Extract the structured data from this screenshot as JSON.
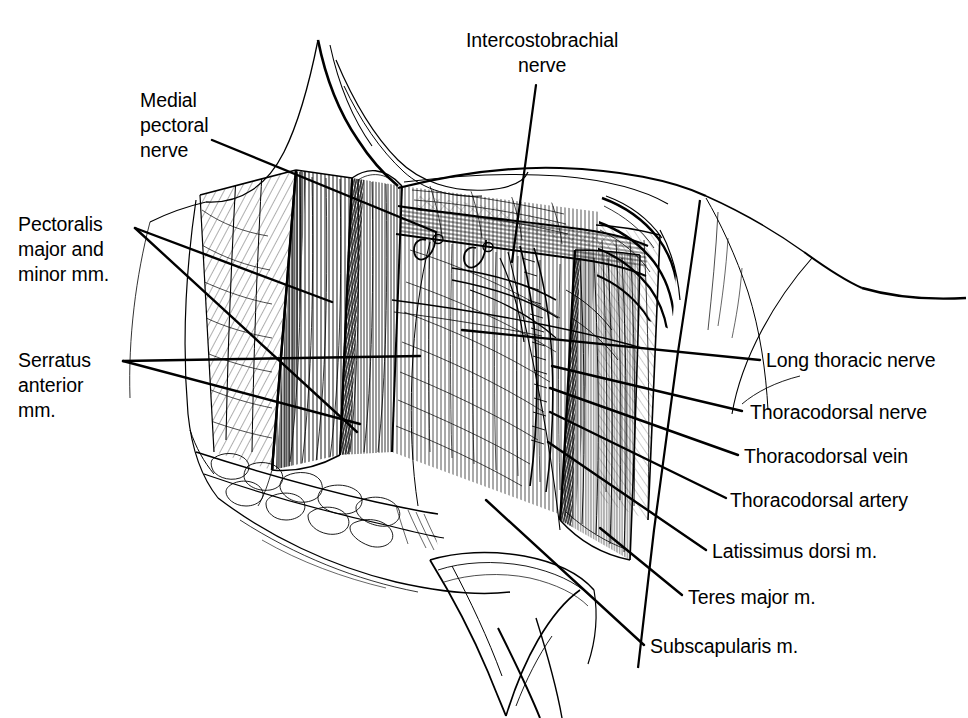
{
  "figure": {
    "kind": "anatomical-line-drawing",
    "style": "black and white pen-and-ink medical illustration",
    "background_color": "#ffffff",
    "ink_color": "#000000"
  },
  "labels": {
    "medial_pectoral_nerve": {
      "lines": [
        "Medial",
        "pectoral",
        "nerve"
      ],
      "text": "Medial pectoral nerve",
      "position": "upper-left",
      "align": "left"
    },
    "pectoralis_major_and_minor": {
      "lines": [
        "Pectoralis",
        "major and",
        "minor mm."
      ],
      "text": "Pectoralis major and minor mm.",
      "position": "mid-left",
      "align": "left"
    },
    "serratus_anterior": {
      "lines": [
        "Serratus",
        "anterior",
        "mm."
      ],
      "text": "Serratus anterior mm.",
      "position": "lower-left",
      "align": "left"
    },
    "intercostobrachial_nerve": {
      "lines": [
        "Intercostobrachial",
        "nerve"
      ],
      "text": "Intercostobrachial nerve",
      "position": "top-center",
      "align": "center"
    },
    "long_thoracic_nerve": {
      "lines": [
        "Long thoracic nerve"
      ],
      "text": "Long thoracic nerve",
      "position": "right",
      "align": "left"
    },
    "thoracodorsal_nerve": {
      "lines": [
        "Thoracodorsal nerve"
      ],
      "text": "Thoracodorsal nerve",
      "position": "right",
      "align": "left"
    },
    "thoracodorsal_vein": {
      "lines": [
        "Thoracodorsal vein"
      ],
      "text": "Thoracodorsal vein",
      "position": "right",
      "align": "left"
    },
    "thoracodorsal_artery": {
      "lines": [
        "Thoracodorsal artery"
      ],
      "text": "Thoracodorsal artery",
      "position": "right",
      "align": "left"
    },
    "latissimus_dorsi": {
      "lines": [
        "Latissimus dorsi m."
      ],
      "text": "Latissimus dorsi m.",
      "position": "right",
      "align": "left"
    },
    "teres_major": {
      "lines": [
        "Teres major m."
      ],
      "text": "Teres major m.",
      "position": "right",
      "align": "left"
    },
    "subscapularis": {
      "lines": [
        "Subscapularis m."
      ],
      "text": "Subscapularis m.",
      "position": "right",
      "align": "left"
    }
  }
}
